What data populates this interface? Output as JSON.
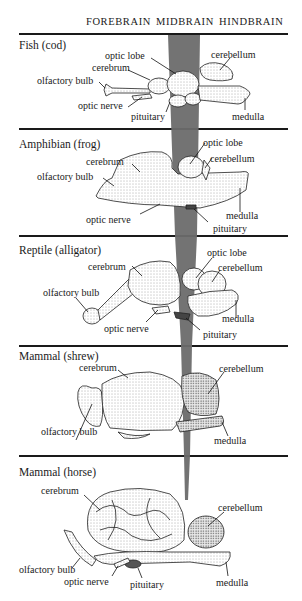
{
  "header": {
    "columns": [
      "FOREBRAIN",
      "MIDBRAIN",
      "HINDBRAIN"
    ]
  },
  "band": {
    "color": "#6e6e6e",
    "description": "midbrain vertical band tapering toward bottom"
  },
  "sections": [
    {
      "title": "Fish (cod)",
      "labels": {
        "optic_lobe": "optic lobe",
        "cerebrum": "cerebrum",
        "olfactory_bulb": "olfactory bulb",
        "optic_nerve": "optic nerve",
        "pituitary": "pituitary",
        "cerebellum": "cerebellum",
        "medulla": "medulla"
      }
    },
    {
      "title": "Amphibian (frog)",
      "labels": {
        "cerebrum": "cerebrum",
        "olfactory_bulb": "olfactory bulb",
        "optic_nerve": "optic nerve",
        "optic_lobe": "optic lobe",
        "cerebellum": "cerebellum",
        "medulla": "medulla",
        "pituitary": "pituitary"
      }
    },
    {
      "title": "Reptile (alligator)",
      "labels": {
        "cerebrum": "cerebrum",
        "olfactory_bulb": "olfactory bulb",
        "optic_nerve": "optic nerve",
        "optic_lobe": "optic lobe",
        "cerebellum": "cerebellum",
        "medulla": "medulla",
        "pituitary": "pituitary"
      }
    },
    {
      "title": "Mammal (shrew)",
      "labels": {
        "cerebrum": "cerebrum",
        "olfactory_bulb": "olfactory bulb",
        "cerebellum": "cerebellum",
        "medulla": "medulla"
      }
    },
    {
      "title": "Mammal (horse)",
      "labels": {
        "cerebrum": "cerebrum",
        "olfactory_bulb": "olfactory bulb",
        "optic_nerve": "optic nerve",
        "pituitary": "pituitary",
        "cerebellum": "cerebellum",
        "medulla": "medulla"
      }
    }
  ]
}
